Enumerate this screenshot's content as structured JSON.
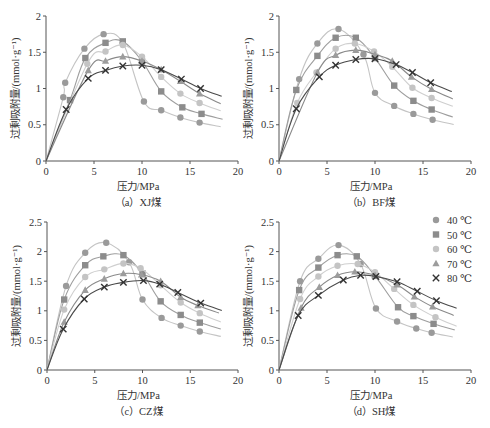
{
  "legend": {
    "items": [
      {
        "label": "40 ℃",
        "marker": "circle",
        "color": "#9a9a9a",
        "line": "#c4c4c4"
      },
      {
        "label": "50 ℃",
        "marker": "square",
        "color": "#8c8c8c",
        "line": "#9e9e9e"
      },
      {
        "label": "60 ℃",
        "marker": "diamond",
        "color": "#c4c4c4",
        "line": "#cfcfcf"
      },
      {
        "label": "70 ℃",
        "marker": "triangle",
        "color": "#9c9c9c",
        "line": "#8a8a8a"
      },
      {
        "label": "80 ℃",
        "marker": "cross",
        "color": "#333333",
        "line": "#4a4a4a"
      }
    ]
  },
  "chart_data": [
    {
      "type": "scatter",
      "panel": "a",
      "caption": "（a）XJ煤",
      "xlabel": "压力/MPa",
      "ylabel": "过剩吸附量/(mmol·g⁻¹)",
      "xlim": [
        0,
        20
      ],
      "ylim": [
        0,
        2
      ],
      "xticks": [
        0,
        5,
        10,
        15,
        20
      ],
      "yticks": [
        0,
        0.5,
        1,
        1.5,
        2
      ],
      "yticklabels": [
        "0",
        "0.5",
        "1",
        "1.5",
        "2"
      ],
      "grid": false,
      "series": [
        {
          "name": "40 ℃",
          "x": [
            1.8,
            2.0,
            4.0,
            6.0,
            8.0,
            10.2,
            12.0,
            14.0,
            16.0
          ],
          "y": [
            0.88,
            1.08,
            1.55,
            1.75,
            1.63,
            0.82,
            0.7,
            0.6,
            0.53
          ]
        },
        {
          "name": "50 ℃",
          "x": [
            2.5,
            4.1,
            6.2,
            8.0,
            10.0,
            12.0,
            14.2,
            16.2
          ],
          "y": [
            0.84,
            1.42,
            1.63,
            1.65,
            1.38,
            0.96,
            0.74,
            0.65
          ]
        },
        {
          "name": "60 ℃",
          "x": [
            4.3,
            6.2,
            8.0,
            10.0,
            12.0,
            14.0,
            16.0
          ],
          "y": [
            1.34,
            1.51,
            1.6,
            1.44,
            1.16,
            0.93,
            0.8
          ]
        },
        {
          "name": "70 ℃",
          "x": [
            4.4,
            6.2,
            8.0,
            10.0,
            12.0,
            14.0,
            16.0
          ],
          "y": [
            1.25,
            1.38,
            1.44,
            1.38,
            1.26,
            1.1,
            0.93
          ]
        },
        {
          "name": "80 ℃",
          "x": [
            2.1,
            4.4,
            6.2,
            8.0,
            10.0,
            12.0,
            14.1,
            16.1
          ],
          "y": [
            0.71,
            1.14,
            1.25,
            1.31,
            1.32,
            1.26,
            1.13,
            1.0
          ]
        }
      ]
    },
    {
      "type": "scatter",
      "panel": "b",
      "caption": "（b）BF煤",
      "xlabel": "压力/MPa",
      "ylabel": "过剩吸附量/(mmol·g⁻¹)",
      "xlim": [
        0,
        20
      ],
      "ylim": [
        0,
        2
      ],
      "xticks": [
        0,
        5,
        10,
        15,
        20
      ],
      "yticks": [
        0,
        0.5,
        1,
        1.5,
        2
      ],
      "yticklabels": [
        "0",
        "0.5",
        "1",
        "1.5",
        "2"
      ],
      "grid": false,
      "series": [
        {
          "name": "40 ℃",
          "x": [
            2.1,
            4.0,
            6.2,
            8.8,
            10.0,
            12.0,
            14.0,
            16.0
          ],
          "y": [
            1.13,
            1.62,
            1.82,
            1.47,
            0.94,
            0.76,
            0.65,
            0.57
          ]
        },
        {
          "name": "50 ℃",
          "x": [
            1.8,
            4.0,
            5.9,
            8.0,
            10.0,
            12.0,
            14.0,
            15.9
          ],
          "y": [
            0.98,
            1.45,
            1.7,
            1.7,
            1.42,
            1.04,
            0.83,
            0.71
          ]
        },
        {
          "name": "60 ℃",
          "x": [
            1.9,
            3.9,
            5.9,
            7.9,
            9.9,
            11.8,
            13.9,
            15.9
          ],
          "y": [
            0.8,
            1.22,
            1.55,
            1.62,
            1.51,
            1.3,
            1.01,
            0.87
          ]
        },
        {
          "name": "70 ℃",
          "x": [
            4.0,
            5.9,
            8.0,
            10.0,
            11.8,
            13.8,
            15.9
          ],
          "y": [
            1.22,
            1.46,
            1.53,
            1.47,
            1.38,
            1.16,
            0.99
          ]
        },
        {
          "name": "80 ℃",
          "x": [
            1.8,
            4.2,
            5.9,
            8.0,
            10.0,
            12.2,
            13.9,
            15.8
          ],
          "y": [
            0.72,
            1.16,
            1.32,
            1.4,
            1.41,
            1.33,
            1.22,
            1.08
          ]
        }
      ]
    },
    {
      "type": "scatter",
      "panel": "c",
      "caption": "（c）CZ煤",
      "xlabel": "压力/MPa",
      "ylabel": "过剩吸附量/(mmol·g⁻¹)",
      "xlim": [
        0,
        20
      ],
      "ylim": [
        0,
        2.5
      ],
      "xticks": [
        0,
        5,
        10,
        15,
        20
      ],
      "yticks": [
        0,
        0.5,
        1,
        1.5,
        2,
        2.5
      ],
      "yticklabels": [
        "0",
        "0.5",
        "1",
        "1.5",
        "2",
        "2.5"
      ],
      "grid": false,
      "series": [
        {
          "name": "40 ℃",
          "x": [
            2.0,
            4.0,
            6.2,
            8.6,
            10.0,
            12.0,
            14.0,
            16.0
          ],
          "y": [
            1.42,
            1.98,
            2.15,
            1.82,
            1.19,
            0.88,
            0.75,
            0.65
          ]
        },
        {
          "name": "50 ℃",
          "x": [
            1.8,
            4.0,
            5.9,
            8.0,
            10.0,
            11.9,
            14.0,
            16.0
          ],
          "y": [
            1.19,
            1.77,
            1.92,
            1.94,
            1.63,
            1.16,
            0.93,
            0.8
          ]
        },
        {
          "name": "60 ℃",
          "x": [
            1.8,
            4.0,
            6.0,
            8.0,
            9.8,
            11.9,
            14.0,
            16.0
          ],
          "y": [
            1.02,
            1.57,
            1.7,
            1.8,
            1.72,
            1.43,
            1.14,
            0.96
          ]
        },
        {
          "name": "70 ℃",
          "x": [
            1.8,
            4.0,
            6.0,
            8.0,
            9.9,
            11.9,
            14.0,
            15.8
          ],
          "y": [
            0.81,
            1.35,
            1.54,
            1.63,
            1.61,
            1.5,
            1.23,
            1.09
          ]
        },
        {
          "name": "80 ℃",
          "x": [
            1.7,
            3.9,
            6.0,
            8.0,
            10.1,
            11.8,
            13.7,
            16.1
          ],
          "y": [
            0.69,
            1.2,
            1.4,
            1.48,
            1.51,
            1.45,
            1.31,
            1.13
          ]
        }
      ]
    },
    {
      "type": "scatter",
      "panel": "d",
      "caption": "（d）SH煤",
      "xlabel": "压力/MPa",
      "ylabel": "过剩吸附量/(mmol·g⁻¹)",
      "xlim": [
        0,
        20
      ],
      "ylim": [
        0,
        2.5
      ],
      "xticks": [
        0,
        5,
        10,
        15,
        20
      ],
      "yticks": [
        0,
        0.5,
        1,
        1.5,
        2,
        2.5
      ],
      "yticklabels": [
        "0",
        "0.5",
        "1",
        "1.5",
        "2",
        "2.5"
      ],
      "grid": false,
      "series": [
        {
          "name": "40 ℃",
          "x": [
            2.2,
            4.1,
            6.2,
            8.5,
            10.1,
            12.3,
            14.3,
            15.9
          ],
          "y": [
            1.5,
            1.88,
            2.11,
            1.79,
            1.04,
            0.82,
            0.7,
            0.63
          ]
        },
        {
          "name": "50 ℃",
          "x": [
            2.1,
            4.1,
            6.1,
            8.1,
            10.0,
            12.4,
            14.0,
            16.1
          ],
          "y": [
            1.35,
            1.73,
            1.94,
            1.92,
            1.59,
            1.06,
            0.91,
            0.78
          ]
        },
        {
          "name": "60 ℃",
          "x": [
            2.2,
            4.1,
            6.1,
            8.2,
            10.0,
            12.0,
            14.0,
            16.3
          ],
          "y": [
            1.2,
            1.58,
            1.76,
            1.79,
            1.65,
            1.37,
            1.1,
            0.89
          ]
        },
        {
          "name": "70 ℃",
          "x": [
            2.3,
            4.2,
            6.1,
            7.9,
            10.0,
            12.3,
            14.1,
            16.0
          ],
          "y": [
            1.05,
            1.4,
            1.6,
            1.66,
            1.6,
            1.44,
            1.24,
            1.07
          ]
        },
        {
          "name": "80 ℃",
          "x": [
            2.0,
            4.1,
            6.7,
            8.5,
            10.1,
            12.3,
            14.4,
            16.4
          ],
          "y": [
            0.92,
            1.26,
            1.52,
            1.6,
            1.58,
            1.49,
            1.33,
            1.17
          ]
        }
      ]
    }
  ]
}
